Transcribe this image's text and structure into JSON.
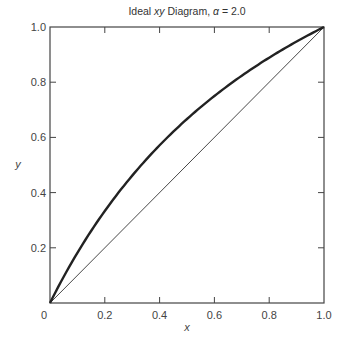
{
  "chart_data": {
    "type": "line",
    "title": "Ideal xy Diagram, α = 2.0",
    "title_parts": {
      "prefix": "Ideal ",
      "italic": "xy",
      "suffix": " Diagram, ",
      "alpha": "α",
      "value": " = 2.0"
    },
    "xlabel": "x",
    "ylabel": "y",
    "xlim": [
      0,
      1.0
    ],
    "ylim": [
      0,
      1.0
    ],
    "x_ticks": [
      "0",
      "0.2",
      "0.4",
      "0.6",
      "0.8",
      "1.0"
    ],
    "y_ticks": [
      "0.2",
      "0.4",
      "0.6",
      "0.8",
      "1.0"
    ],
    "grid": false,
    "legend": null,
    "series": [
      {
        "name": "Equilibrium curve (α = 2.0)",
        "style": "thick",
        "x": [
          0,
          0.1,
          0.2,
          0.3,
          0.4,
          0.5,
          0.6,
          0.7,
          0.8,
          0.9,
          1.0
        ],
        "y": [
          0,
          0.182,
          0.333,
          0.462,
          0.571,
          0.667,
          0.75,
          0.824,
          0.889,
          0.947,
          1.0
        ]
      },
      {
        "name": "y = x diagonal",
        "style": "thin",
        "x": [
          0,
          1.0
        ],
        "y": [
          0,
          1.0
        ]
      }
    ]
  }
}
